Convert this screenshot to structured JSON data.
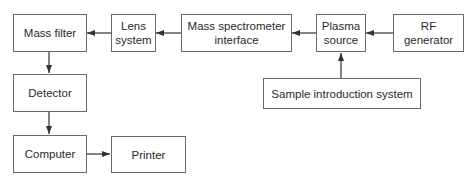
{
  "diagram": {
    "type": "block-diagram",
    "nodes": [
      {
        "id": "mass_filter",
        "label": "Mass filter"
      },
      {
        "id": "lens_system",
        "label": "Lens\nsystem"
      },
      {
        "id": "ms_interface",
        "label": "Mass spectrometer\ninterface"
      },
      {
        "id": "plasma_source",
        "label": "Plasma\nsource"
      },
      {
        "id": "rf_generator",
        "label": "RF\ngenerator"
      },
      {
        "id": "detector",
        "label": "Detector"
      },
      {
        "id": "computer",
        "label": "Computer"
      },
      {
        "id": "printer",
        "label": "Printer"
      },
      {
        "id": "sample_intro",
        "label": "Sample introduction system"
      }
    ],
    "edges": [
      {
        "from": "rf_generator",
        "to": "plasma_source"
      },
      {
        "from": "sample_intro",
        "to": "plasma_source"
      },
      {
        "from": "plasma_source",
        "to": "ms_interface"
      },
      {
        "from": "ms_interface",
        "to": "lens_system"
      },
      {
        "from": "lens_system",
        "to": "mass_filter"
      },
      {
        "from": "mass_filter",
        "to": "detector"
      },
      {
        "from": "detector",
        "to": "computer"
      },
      {
        "from": "computer",
        "to": "printer"
      }
    ],
    "colors": {
      "line": "#333333",
      "border": "#6a6a6a",
      "background": "#ffffff"
    }
  },
  "labels": {
    "mass_filter": "Mass filter",
    "lens_line1": "Lens",
    "lens_line2": "system",
    "ms_line1": "Mass spectrometer",
    "ms_line2": "interface",
    "plasma_line1": "Plasma",
    "plasma_line2": "source",
    "rf_line1": "RF",
    "rf_line2": "generator",
    "detector": "Detector",
    "computer": "Computer",
    "printer": "Printer",
    "sample_intro": "Sample introduction system"
  }
}
